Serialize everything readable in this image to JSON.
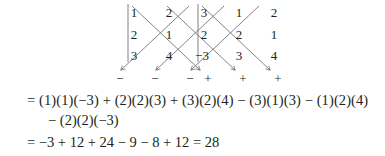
{
  "diagram": {
    "name": "sarrus-rule-determinant-diagram",
    "divider_label": "matrix-divider",
    "matrix_rows": [
      [
        "1",
        "2",
        "3"
      ],
      [
        "2",
        "1",
        "2"
      ],
      [
        "3",
        "4",
        "−3"
      ]
    ],
    "repeated_columns_rows": [
      [
        "1",
        "2"
      ],
      [
        "2",
        "1"
      ],
      [
        "3",
        "4"
      ]
    ],
    "signs": [
      "−",
      "−",
      "−",
      "+",
      "+",
      "+"
    ],
    "arrow_directions": [
      "down-left",
      "down-left",
      "down-left",
      "down-right",
      "down-right",
      "down-right"
    ],
    "line_color": "#6d6e71"
  },
  "equations": {
    "line1": "= (1)(1)(−3) + (2)(2)(3) + (3)(2)(4) − (3)(1)(3) − (1)(2)(4)",
    "line2": "− (2)(2)(−3)",
    "line3": "= −3 + 12 + 24 − 9 − 8 + 12 = 28"
  },
  "result": "28",
  "colors": {
    "text": "#231f20",
    "stroke": "#6d6e71",
    "background": "#ffffff"
  }
}
